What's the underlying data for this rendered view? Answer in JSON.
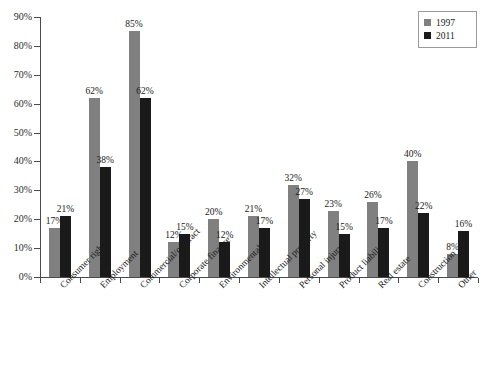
{
  "chart_data": {
    "type": "bar",
    "title": "",
    "subtitle": "",
    "xlabel": "",
    "ylabel": "",
    "ylim": [
      0,
      90
    ],
    "ytick_labels": [
      "0%",
      "10%",
      "20%",
      "30%",
      "40%",
      "50%",
      "60%",
      "70%",
      "80%",
      "90%"
    ],
    "ytick_values": [
      0,
      10,
      20,
      30,
      40,
      50,
      60,
      70,
      80,
      90
    ],
    "grid": false,
    "legend_position": "top-right",
    "categories": [
      "Consumer rights",
      "Employment",
      "Commercial/contract",
      "Corporate finance",
      "Environmental",
      "Intellectual property",
      "Personal injury",
      "Product liability",
      "Real estate",
      "Construction",
      "Other"
    ],
    "series": [
      {
        "name": "1997",
        "color": "#808080",
        "values": [
          17,
          62,
          85,
          12,
          20,
          21,
          32,
          23,
          26,
          40,
          8
        ],
        "labels": [
          "17%",
          "62%",
          "85%",
          "12%",
          "20%",
          "21%",
          "32%",
          "23%",
          "26%",
          "40%",
          "8%"
        ]
      },
      {
        "name": "2011",
        "color": "#1a1a1a",
        "values": [
          21,
          38,
          62,
          15,
          12,
          17,
          27,
          15,
          17,
          22,
          16
        ],
        "labels": [
          "21%",
          "38%",
          "62%",
          "15%",
          "12%",
          "17%",
          "27%",
          "15%",
          "17%",
          "22%",
          "16%"
        ]
      }
    ]
  },
  "legend": {
    "items": [
      {
        "label": "1997",
        "swatch": "s1997"
      },
      {
        "label": "2011",
        "swatch": "s2011"
      }
    ]
  },
  "bottom_caption": ""
}
